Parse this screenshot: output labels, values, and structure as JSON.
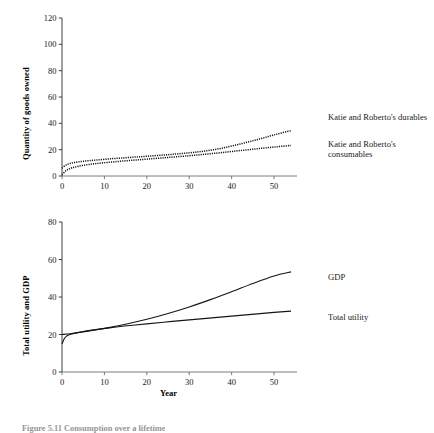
{
  "figure": {
    "caption": "Figure 5.11   Consumption over a lifetime",
    "panels": [
      {
        "id": "goods-owned",
        "ylabel": "Quantity of goods owned",
        "xlabel": "",
        "legend": [
          "Katie and Roberto's durables",
          "Katie and Roberto's consumables"
        ]
      },
      {
        "id": "utility-gdp",
        "ylabel": "Total utility and GDP",
        "xlabel": "Year",
        "legend": [
          "GDP",
          "Total utility"
        ]
      }
    ]
  },
  "chart_data": [
    {
      "type": "line",
      "id": "goods-owned",
      "title": "",
      "xlabel": "",
      "ylabel": "Quantity of goods owned",
      "xlim": [
        0,
        54
      ],
      "ylim": [
        0,
        120
      ],
      "xticks": [
        0,
        10,
        20,
        30,
        40,
        50
      ],
      "yticks": [
        0,
        20,
        40,
        60,
        80,
        100,
        120
      ],
      "grid": false,
      "legend_position": "right",
      "series": [
        {
          "name": "Katie and Roberto's durables",
          "style": "dotted",
          "x": [
            0,
            1,
            2,
            3,
            5,
            8,
            12,
            16,
            20,
            25,
            30,
            34,
            38,
            42,
            46,
            50,
            54
          ],
          "values": [
            6.0,
            8.4,
            9.6,
            10.3,
            11.2,
            12.1,
            13.2,
            14.1,
            15.0,
            16.2,
            17.6,
            19.1,
            21.3,
            24.3,
            27.6,
            31.2,
            34.5
          ]
        },
        {
          "name": "Katie and Roberto's consumables",
          "style": "dotted",
          "x": [
            0,
            1,
            2,
            3,
            5,
            8,
            12,
            16,
            20,
            25,
            30,
            34,
            38,
            42,
            46,
            50,
            54
          ],
          "values": [
            1.0,
            4.2,
            5.8,
            6.8,
            8.1,
            9.4,
            10.7,
            11.8,
            12.8,
            14.1,
            15.4,
            16.6,
            17.9,
            19.3,
            20.7,
            22.0,
            23.2
          ]
        }
      ]
    },
    {
      "type": "line",
      "id": "utility-gdp",
      "title": "",
      "xlabel": "Year",
      "ylabel": "Total utility and GDP",
      "xlim": [
        0,
        54
      ],
      "ylim": [
        0,
        80
      ],
      "xticks": [
        0,
        10,
        20,
        30,
        40,
        50
      ],
      "yticks": [
        0,
        20,
        40,
        60,
        80
      ],
      "grid": false,
      "legend_position": "right",
      "series": [
        {
          "name": "GDP",
          "style": "solid",
          "x": [
            0,
            2,
            5,
            10,
            15,
            20,
            25,
            30,
            35,
            40,
            45,
            50,
            54
          ],
          "values": [
            20.0,
            20.4,
            21.4,
            23.3,
            25.5,
            28.1,
            31.2,
            34.7,
            38.6,
            42.8,
            47.2,
            51.2,
            53.4
          ]
        },
        {
          "name": "Total utility",
          "style": "solid",
          "x": [
            0,
            0.5,
            1,
            2,
            3,
            5,
            8,
            12,
            16,
            20,
            26,
            32,
            38,
            44,
            50,
            54
          ],
          "values": [
            15.0,
            17.6,
            19.0,
            20.1,
            20.7,
            21.6,
            22.6,
            23.8,
            24.8,
            25.7,
            27.0,
            28.2,
            29.4,
            30.6,
            31.8,
            32.5
          ]
        }
      ]
    }
  ]
}
